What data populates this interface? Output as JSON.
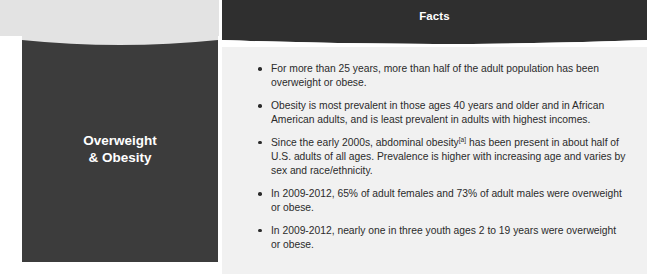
{
  "table": {
    "columns": [
      {
        "label": "Health Condition",
        "style": "light"
      },
      {
        "label": "Facts",
        "style": "dark"
      }
    ],
    "condition": {
      "title_line1": "Overweight",
      "title_line2": "& Obesity"
    },
    "facts": [
      {
        "text_before": "For more than 25 years, more than half of the adult population has been overweight or obese.",
        "superscript": "",
        "text_after": ""
      },
      {
        "text_before": "Obesity is most prevalent in those ages 40 years and older and in African American adults, and is least prevalent in adults with highest incomes.",
        "superscript": "",
        "text_after": ""
      },
      {
        "text_before": "Since the early 2000s, abdominal obesity",
        "superscript": "[a]",
        "text_after": " has been present in about half of U.S. adults of all ages. Prevalence is higher with increasing age and varies by sex and race/ethnicity."
      },
      {
        "text_before": "In 2009-2012, 65% of adult females and 73% of adult males were overweight or obese.",
        "superscript": "",
        "text_after": ""
      },
      {
        "text_before": "In 2009-2012, nearly one in three youth ages 2 to 19 years were overweight or obese.",
        "superscript": "",
        "text_after": ""
      }
    ]
  },
  "colors": {
    "header_light_bg": "#e3e3e3",
    "header_dark_bg": "#2f2f2f",
    "condition_panel_bg": "#3c3c3c",
    "facts_panel_bg": "#f1f1f1",
    "body_text": "#2b2b2b",
    "header_light_text": "#1a1a1a",
    "header_dark_text": "#ffffff"
  }
}
